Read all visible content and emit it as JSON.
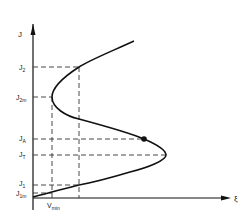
{
  "diagram": {
    "axes": {
      "y_label": "J",
      "x_label": "ξ"
    },
    "y_levels": [
      {
        "id": "J2",
        "main": "J",
        "sub": "2"
      },
      {
        "id": "J2m",
        "main": "J",
        "sub": "2m"
      },
      {
        "id": "JA",
        "main": "J",
        "sub": "A"
      },
      {
        "id": "JT",
        "main": "J",
        "sub": "T"
      },
      {
        "id": "J1",
        "main": "J",
        "sub": "1"
      },
      {
        "id": "J1m",
        "main": "J",
        "sub": "1m"
      }
    ],
    "x_levels": [
      {
        "id": "Vmin",
        "main": "V",
        "sub": "min"
      }
    ],
    "marked_point": "J_A",
    "colors": {
      "curve": "#111111",
      "dashed": "#333333",
      "axes": "#111111",
      "background": "#ffffff"
    }
  }
}
